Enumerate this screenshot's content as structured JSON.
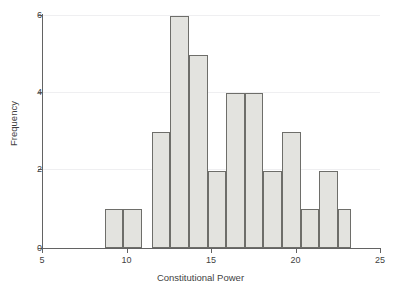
{
  "chart_data": {
    "type": "bar",
    "title": "",
    "subtitle": "",
    "xlabel": "Constitutional Power",
    "ylabel": "Frequency",
    "xlim": [
      5,
      25
    ],
    "ylim": [
      0,
      6
    ],
    "xticks": [
      5,
      10,
      15,
      20,
      25
    ],
    "xtick_labels": [
      "5",
      "10",
      "15",
      "20",
      "25"
    ],
    "yticks": [
      0,
      2,
      4,
      6
    ],
    "ytick_labels": [
      "0",
      "2",
      "4",
      "6"
    ],
    "grid": "horizontal-light",
    "legend": null,
    "bin_width": 1.1,
    "bin_edges": [
      8.7,
      9.8,
      10.9,
      11.5,
      12.6,
      13.7,
      14.8,
      15.9,
      17.0,
      18.1,
      19.2,
      20.3,
      21.4,
      22.5
    ],
    "bars": [
      {
        "x_start": 8.7,
        "x_end": 9.8,
        "value": 1
      },
      {
        "x_start": 9.8,
        "x_end": 10.9,
        "value": 1
      },
      {
        "x_start": 11.5,
        "x_end": 12.6,
        "value": 3
      },
      {
        "x_start": 12.6,
        "x_end": 13.7,
        "value": 6
      },
      {
        "x_start": 13.7,
        "x_end": 14.8,
        "value": 5
      },
      {
        "x_start": 14.8,
        "x_end": 15.9,
        "value": 2
      },
      {
        "x_start": 15.9,
        "x_end": 17.0,
        "value": 4
      },
      {
        "x_start": 17.0,
        "x_end": 18.1,
        "value": 4
      },
      {
        "x_start": 18.1,
        "x_end": 19.2,
        "value": 2
      },
      {
        "x_start": 19.2,
        "x_end": 20.3,
        "value": 3
      },
      {
        "x_start": 20.3,
        "x_end": 21.4,
        "value": 1
      },
      {
        "x_start": 21.4,
        "x_end": 22.5,
        "value": 2
      },
      {
        "x_start": 22.5,
        "x_end": 23.3,
        "value": 1
      }
    ],
    "categories": [
      "8.7-9.8",
      "9.8-10.9",
      "11.5-12.6",
      "12.6-13.7",
      "13.7-14.8",
      "14.8-15.9",
      "15.9-17.0",
      "17.0-18.1",
      "18.1-19.2",
      "19.2-20.3",
      "20.3-21.4",
      "21.4-22.5",
      "22.5-23.3"
    ],
    "values": [
      1,
      1,
      3,
      6,
      5,
      2,
      4,
      4,
      2,
      3,
      1,
      2,
      1
    ],
    "colors": {
      "bar_fill": "#e3e3df",
      "bar_edge": "#6e6e6a",
      "axis": "#636363",
      "grid": "#efeff1",
      "text": "#3f3f3f",
      "background": "#ffffff"
    }
  }
}
